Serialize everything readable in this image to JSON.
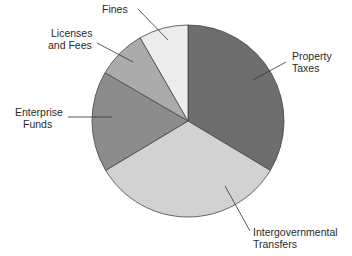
{
  "chart_data": {
    "type": "pie",
    "title": "",
    "start_angle_deg": 0,
    "direction": "clockwise",
    "slices": [
      {
        "label": "Property Taxes",
        "lines": [
          "Property",
          "Taxes"
        ],
        "value": 33.6,
        "color": "#6e6e6e"
      },
      {
        "label": "Intergovernmental Transfers",
        "lines": [
          "Intergovernmental",
          "Transfers"
        ],
        "value": 32.8,
        "color": "#d2d2d2"
      },
      {
        "label": "Enterprise Funds",
        "lines": [
          "Enterprise",
          "Funds"
        ],
        "value": 17.0,
        "color": "#8c8c8c"
      },
      {
        "label": "Licenses and Fees",
        "lines": [
          "Licenses",
          "and Fees"
        ],
        "value": 8.3,
        "color": "#ababab"
      },
      {
        "label": "Fines",
        "lines": [
          "Fines"
        ],
        "value": 8.3,
        "color": "#ececec"
      }
    ],
    "legend": "none (direct labels with leader lines)"
  },
  "labels": {
    "property_1": "Property",
    "property_2": "Taxes",
    "intergov_1": "Intergovernmental",
    "intergov_2": "Transfers",
    "enterprise_1": "Enterprise",
    "enterprise_2": "Funds",
    "licenses_1": "Licenses",
    "licenses_2": "and Fees",
    "fines": "Fines"
  }
}
